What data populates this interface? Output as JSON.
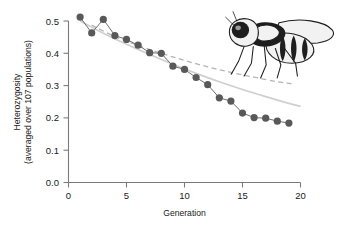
{
  "chart_data": {
    "type": "line",
    "title": "",
    "xlabel": "Generation",
    "ylabel": "Heterozygosity\n(averaged over 107 populations)",
    "ylabel_line1": "Heterozygosity",
    "ylabel_line2": "(averaged over 107 populations)",
    "xlim": [
      0,
      20
    ],
    "ylim": [
      0.0,
      0.5
    ],
    "xticks": [
      0,
      5,
      10,
      15,
      20
    ],
    "xtick_labels": [
      "0",
      "5",
      "10",
      "15",
      "20"
    ],
    "yticks": [
      0.0,
      0.1,
      0.2,
      0.3,
      0.4,
      0.5
    ],
    "ytick_labels": [
      "0.0",
      "0.1",
      "0.2",
      "0.3",
      "0.4",
      "0.5"
    ],
    "grid": false,
    "legend": "none",
    "series": [
      {
        "name": "Observed heterozygosity",
        "style": "markers-with-line",
        "color": "#595959",
        "x": [
          1,
          2,
          3,
          4,
          5,
          6,
          7,
          8,
          9,
          10,
          11,
          12,
          13,
          14,
          15,
          16,
          17,
          18,
          19
        ],
        "values": [
          0.512,
          0.463,
          0.505,
          0.455,
          0.443,
          0.425,
          0.402,
          0.4,
          0.36,
          0.35,
          0.325,
          0.303,
          0.262,
          0.252,
          0.215,
          0.201,
          0.199,
          0.19,
          0.184
        ]
      },
      {
        "name": "Predicted decline (solid)",
        "style": "solid-curve",
        "color": "#cfcfcf",
        "x": [
          1,
          3,
          5,
          7,
          9,
          11,
          13,
          15,
          17,
          19,
          20
        ],
        "values": [
          0.5,
          0.462,
          0.428,
          0.396,
          0.366,
          0.338,
          0.312,
          0.288,
          0.266,
          0.245,
          0.236
        ]
      },
      {
        "name": "Predicted decline (dashed)",
        "style": "dashed-curve",
        "color": "#b4b4b4",
        "x": [
          2,
          4,
          6,
          8,
          10,
          12,
          14,
          16,
          18,
          19.5
        ],
        "values": [
          0.487,
          0.452,
          0.424,
          0.4,
          0.378,
          0.358,
          0.341,
          0.326,
          0.312,
          0.305
        ]
      }
    ],
    "annotations": [
      {
        "name": "fly-illustration",
        "description": "Drosophila fruit fly line drawing",
        "position": "top-right"
      }
    ]
  },
  "figure": {
    "background_color": "#ffffff",
    "axis_color": "#7a7a7a",
    "marker_color": "#595959",
    "solid_curve_color": "#cfcfcf",
    "dashed_curve_color": "#b4b4b4"
  }
}
